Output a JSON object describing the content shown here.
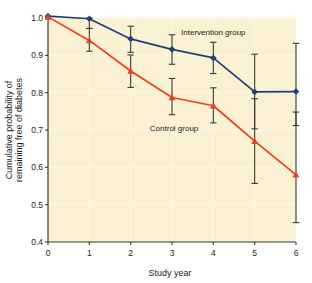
{
  "chart_data": {
    "type": "line",
    "title": "",
    "subtitle": "",
    "xlabel": "Study year",
    "ylabel_line1": "Cumulative probability of",
    "ylabel_line2": "remaining free of diabetes",
    "x": [
      0,
      1,
      2,
      3,
      4,
      5,
      6
    ],
    "xticklabels": [
      "0",
      "1",
      "2",
      "3",
      "4",
      "5",
      "6"
    ],
    "yticklabels": [
      "0.4",
      "0.5",
      "0.6",
      "0.7",
      "0.8",
      "0.9",
      "1.0"
    ],
    "yticks": [
      0.4,
      0.5,
      0.6,
      0.7,
      0.8,
      0.9,
      1.0
    ],
    "xlim": [
      0,
      6
    ],
    "ylim": [
      0.4,
      1.0
    ],
    "grid": true,
    "legend_position": "inline-annotations",
    "plot_background": "#faf0d2",
    "gridline_color": "#fdf8e6",
    "errorbar_color": "#3a3a32",
    "series": [
      {
        "name": "Intervention group",
        "color": "#1f3f7a",
        "marker": "diamond",
        "label_x": 4.0,
        "label_y": 0.955,
        "values": [
          1.005,
          0.998,
          0.944,
          0.916,
          0.893,
          0.802,
          0.803
        ],
        "err_low": [
          1.005,
          0.972,
          0.908,
          0.876,
          0.851,
          0.703,
          0.712
        ],
        "err_high": [
          1.005,
          1.025,
          0.978,
          0.955,
          0.935,
          0.903,
          0.932
        ]
      },
      {
        "name": "Control group",
        "color": "#e8401f",
        "marker": "triangle",
        "label_x": 3.05,
        "label_y": 0.696,
        "values": [
          1.003,
          0.94,
          0.858,
          0.787,
          0.765,
          0.67,
          0.58
        ],
        "err_low": [
          1.003,
          0.911,
          0.814,
          0.741,
          0.719,
          0.557,
          0.452
        ],
        "err_high": [
          1.003,
          0.972,
          0.901,
          0.838,
          0.813,
          0.784,
          0.748
        ]
      }
    ]
  }
}
